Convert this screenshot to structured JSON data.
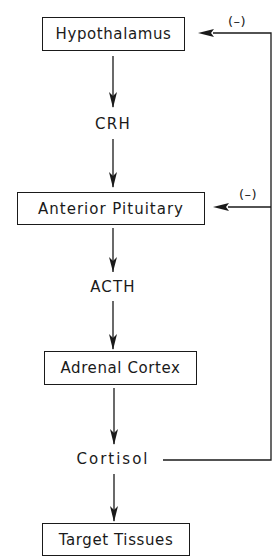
{
  "diagram": {
    "nodes": {
      "hypothalamus": "Hypothalamus",
      "crh": "CRH",
      "anterior_pituitary": "Anterior Pituitary",
      "acth": "ACTH",
      "adrenal_cortex": "Adrenal Cortex",
      "cortisol": "Cortisol",
      "target_tissues": "Target Tissues"
    },
    "feedback": {
      "to_hypothalamus": "(–)",
      "to_anterior_pituitary": "(–)"
    },
    "edges": [
      {
        "from": "Hypothalamus",
        "to": "CRH"
      },
      {
        "from": "CRH",
        "to": "Anterior Pituitary"
      },
      {
        "from": "Anterior Pituitary",
        "to": "ACTH"
      },
      {
        "from": "ACTH",
        "to": "Adrenal Cortex"
      },
      {
        "from": "Adrenal Cortex",
        "to": "Cortisol"
      },
      {
        "from": "Cortisol",
        "to": "Target Tissues"
      },
      {
        "from": "Cortisol",
        "to": "Hypothalamus",
        "type": "negative feedback"
      },
      {
        "from": "Cortisol",
        "to": "Anterior Pituitary",
        "type": "negative feedback"
      }
    ]
  }
}
